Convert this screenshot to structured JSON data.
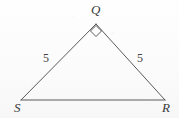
{
  "figure": {
    "kind": "geometry-diagram",
    "shape": "triangle",
    "background_color": "#fdfdfd",
    "stroke_color": "#5a5a5a",
    "label_color": "#3a3a3a",
    "stroke_width": 1,
    "width": 179,
    "height": 118
  },
  "vertices": [
    {
      "id": "Q",
      "label": "Q",
      "x": 96,
      "y": 24,
      "label_x": 91,
      "label_y": 3,
      "position": "apex"
    },
    {
      "id": "S",
      "label": "S",
      "x": 21,
      "y": 100,
      "label_x": 14,
      "label_y": 101,
      "position": "bottom-left"
    },
    {
      "id": "R",
      "label": "R",
      "x": 165,
      "y": 100,
      "label_x": 162,
      "label_y": 101,
      "position": "bottom-right"
    }
  ],
  "edges": [
    {
      "id": "QS",
      "from": "Q",
      "to": "S",
      "length_label": "5"
    },
    {
      "id": "QR",
      "from": "Q",
      "to": "R",
      "length_label": "5"
    },
    {
      "id": "SR",
      "from": "S",
      "to": "R",
      "length_label": ""
    }
  ],
  "side_labels": [
    {
      "edge": "QS",
      "text": "5",
      "x": 43,
      "y": 52
    },
    {
      "edge": "QR",
      "text": "5",
      "x": 137,
      "y": 52
    }
  ],
  "angle_marks": [
    {
      "at_vertex": "Q",
      "type": "right-angle",
      "glyph": "diamond-square",
      "x": 96,
      "y": 31,
      "size": 6
    }
  ],
  "chart_data": {
    "type": "diagram",
    "title": "",
    "points": {
      "Q": [
        96,
        24
      ],
      "S": [
        21,
        100
      ],
      "R": [
        165,
        100
      ]
    },
    "labels": [
      "Q",
      "S",
      "R"
    ],
    "measures": [
      {
        "segment": "QS",
        "value": 5
      },
      {
        "segment": "QR",
        "value": 5
      }
    ],
    "marked_angles": [
      {
        "vertex": "Q",
        "value": 90,
        "unit": "degrees"
      }
    ]
  }
}
